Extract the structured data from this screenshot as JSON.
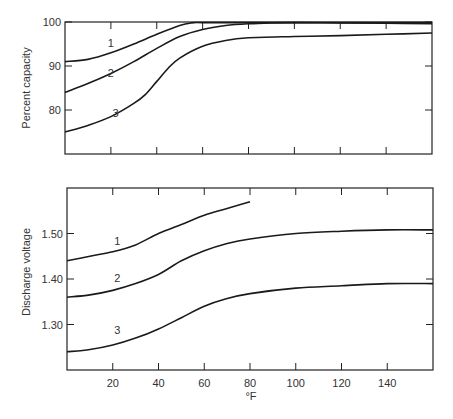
{
  "chart_data": [
    {
      "type": "line",
      "title": "",
      "xlabel": "",
      "ylabel": "Percent capacity",
      "xlim": [
        0,
        160
      ],
      "ylim": [
        70,
        100
      ],
      "x_ticks": [
        20,
        40,
        60,
        80,
        100,
        120,
        140
      ],
      "y_ticks": [
        80,
        90,
        100
      ],
      "y_tick_labels": [
        "80",
        "90",
        "100"
      ],
      "grid": false,
      "series": [
        {
          "name": "1",
          "x": [
            0,
            10,
            20,
            30,
            40,
            50,
            55,
            60,
            80,
            100,
            120,
            140,
            160
          ],
          "values": [
            91,
            91.5,
            93,
            95,
            97.2,
            99.2,
            99.8,
            100,
            100,
            100,
            100,
            100,
            100
          ],
          "label_pos": [
            20,
            93.5
          ]
        },
        {
          "name": "2",
          "x": [
            0,
            10,
            20,
            30,
            40,
            50,
            60,
            70,
            80,
            90,
            100,
            120,
            140,
            160
          ],
          "values": [
            84,
            86,
            88.3,
            91,
            94,
            96.7,
            98.3,
            99.2,
            99.6,
            99.8,
            99.9,
            99.8,
            99.7,
            99.6
          ],
          "label_pos": [
            20,
            86.5
          ]
        },
        {
          "name": "3",
          "x": [
            0,
            10,
            20,
            30,
            35,
            40,
            45,
            50,
            60,
            70,
            80,
            100,
            120,
            140,
            160
          ],
          "values": [
            75,
            76.5,
            78.5,
            81.5,
            83.5,
            86.5,
            89.5,
            91.8,
            94.5,
            95.8,
            96.4,
            96.7,
            96.9,
            97.2,
            97.5
          ],
          "label_pos": [
            22,
            77.5
          ]
        }
      ]
    },
    {
      "type": "line",
      "title": "",
      "xlabel": "°F",
      "ylabel": "Discharge voltage",
      "xlim": [
        0,
        160
      ],
      "ylim": [
        1.2,
        1.6
      ],
      "x_ticks": [
        20,
        40,
        60,
        80,
        100,
        120,
        140
      ],
      "x_tick_labels": [
        "20",
        "40",
        "60",
        "80",
        "100",
        "120",
        "140"
      ],
      "y_ticks": [
        1.3,
        1.4,
        1.5
      ],
      "y_tick_labels": [
        "1.30",
        "1.40",
        "1.50"
      ],
      "grid": false,
      "series": [
        {
          "name": "1",
          "x": [
            0,
            10,
            20,
            30,
            40,
            50,
            60,
            70,
            80
          ],
          "values": [
            1.44,
            1.45,
            1.46,
            1.475,
            1.5,
            1.52,
            1.54,
            1.555,
            1.57
          ],
          "label_pos": [
            22,
            1.465
          ]
        },
        {
          "name": "2",
          "x": [
            0,
            10,
            20,
            30,
            40,
            50,
            60,
            70,
            80,
            100,
            120,
            140,
            160
          ],
          "values": [
            1.36,
            1.365,
            1.375,
            1.39,
            1.41,
            1.44,
            1.462,
            1.478,
            1.488,
            1.5,
            1.505,
            1.508,
            1.508
          ],
          "label_pos": [
            22,
            1.385
          ]
        },
        {
          "name": "3",
          "x": [
            0,
            10,
            20,
            30,
            40,
            50,
            60,
            70,
            80,
            100,
            120,
            140,
            160
          ],
          "values": [
            1.24,
            1.245,
            1.255,
            1.27,
            1.29,
            1.315,
            1.34,
            1.357,
            1.368,
            1.38,
            1.385,
            1.39,
            1.39
          ],
          "label_pos": [
            22,
            1.27
          ]
        }
      ]
    }
  ],
  "labels": {
    "top_ylabel": "Percent capacity",
    "bottom_ylabel": "Discharge voltage",
    "xlabel": "°F"
  }
}
